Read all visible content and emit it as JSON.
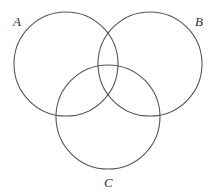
{
  "diagram": {
    "type": "venn",
    "sets": [
      {
        "id": "A",
        "label": "A",
        "cx": 66,
        "cy": 64,
        "r": 52,
        "label_x": 13,
        "label_y": 26
      },
      {
        "id": "B",
        "label": "B",
        "cx": 150,
        "cy": 64,
        "r": 52,
        "label_x": 195,
        "label_y": 26
      },
      {
        "id": "C",
        "label": "C",
        "cx": 108,
        "cy": 117,
        "r": 52,
        "label_x": 104,
        "label_y": 187
      }
    ],
    "colors": {
      "stroke": "#555555",
      "label": "#333333",
      "background": "#ffffff"
    }
  }
}
